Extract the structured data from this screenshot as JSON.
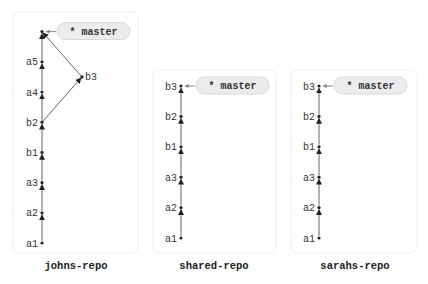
{
  "diagram": {
    "type": "git-commit-graph",
    "colors": {
      "edge": "#666666",
      "node": "#222222",
      "pill_fill": "#ececec",
      "pill_border": "#d8d8d8",
      "box_border": "#eeeeee"
    },
    "repos": [
      {
        "id": "johns",
        "label": "johns-repo",
        "branch_pill": "* master",
        "commits": [
          "a1",
          "a2",
          "a3",
          "b1",
          "b2",
          "a4",
          "a5",
          "",
          "b3"
        ],
        "trunk": [
          "a1",
          "a2",
          "a3",
          "b1",
          "b2",
          "a4",
          "a5",
          "merge"
        ],
        "side": [
          {
            "label": "b3",
            "from": "b2",
            "to": "merge"
          }
        ],
        "head": "merge"
      },
      {
        "id": "shared",
        "label": "shared-repo",
        "branch_pill": "* master",
        "trunk": [
          "a1",
          "a2",
          "a3",
          "b1",
          "b2",
          "b3"
        ],
        "head": "b3"
      },
      {
        "id": "sarahs",
        "label": "sarahs-repo",
        "branch_pill": "* master",
        "trunk": [
          "a1",
          "a2",
          "a3",
          "b1",
          "b2",
          "b3"
        ],
        "head": "b3"
      }
    ]
  }
}
